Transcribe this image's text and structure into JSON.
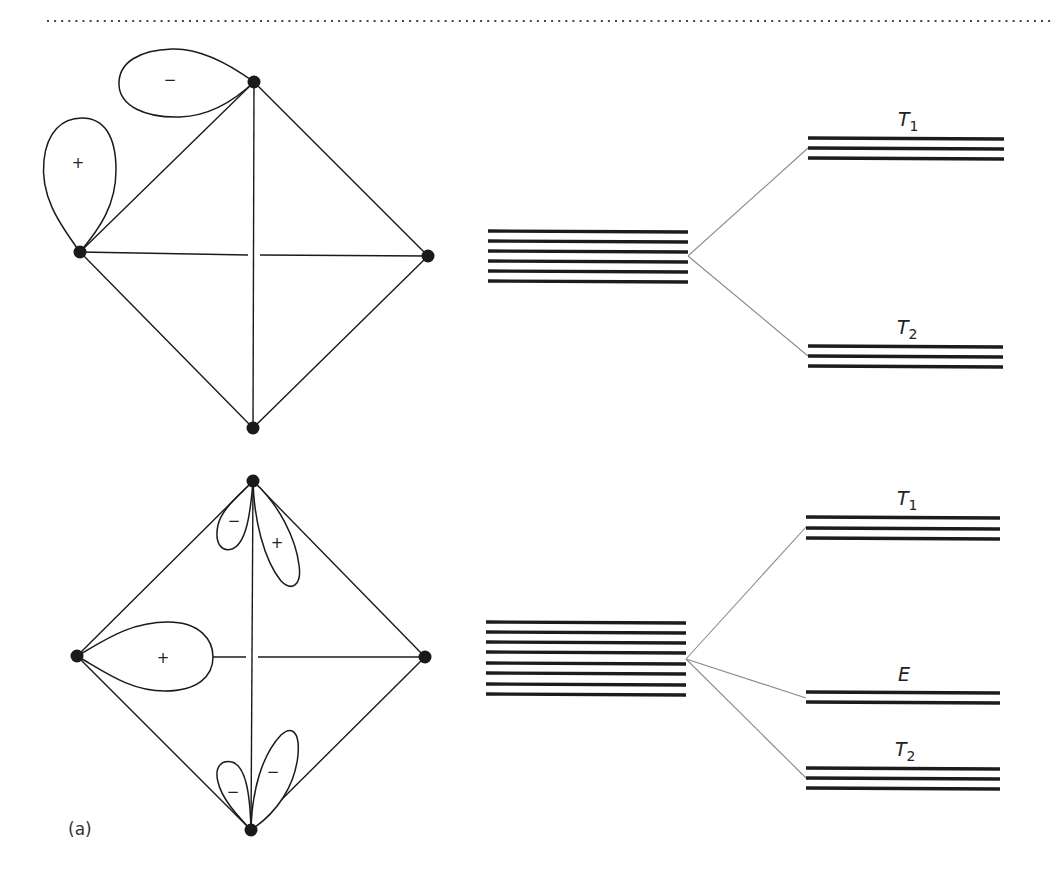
{
  "figure": {
    "panel_label": "(a)",
    "top_separator": "dotted-rule"
  },
  "diagrams": [
    {
      "id": "upper",
      "tetrahedron": {
        "vertices": [
          "top",
          "left",
          "right",
          "bottom"
        ],
        "lobes": [
          {
            "position": "near left vertex, pointing up",
            "sign": "+"
          },
          {
            "position": "near top vertex, pointing left",
            "sign": "−"
          }
        ]
      },
      "splitting": {
        "unsplit_levels": 6,
        "split": [
          {
            "label": "T",
            "subscript": "1",
            "levels": 3,
            "position": "upper"
          },
          {
            "label": "T",
            "subscript": "2",
            "levels": 3,
            "position": "lower"
          }
        ]
      }
    },
    {
      "id": "lower",
      "tetrahedron": {
        "vertices": [
          "top",
          "left",
          "right",
          "bottom"
        ],
        "lobes": [
          {
            "position": "top vertex, left small lobe",
            "sign": "−"
          },
          {
            "position": "top vertex, right long lobe",
            "sign": "+"
          },
          {
            "position": "left vertex, pointing right",
            "sign": "+"
          },
          {
            "position": "bottom vertex, left small lobe",
            "sign": "−"
          },
          {
            "position": "bottom vertex, right long lobe",
            "sign": "−"
          }
        ]
      },
      "splitting": {
        "unsplit_levels": 8,
        "split": [
          {
            "label": "T",
            "subscript": "1",
            "levels": 3,
            "position": "upper"
          },
          {
            "label": "E",
            "subscript": "",
            "levels": 2,
            "position": "middle"
          },
          {
            "label": "T",
            "subscript": "2",
            "levels": 3,
            "position": "lower"
          }
        ]
      }
    }
  ],
  "labels": {
    "upper_t1": "T",
    "upper_t1_sub": "1",
    "upper_t2": "T",
    "upper_t2_sub": "2",
    "lower_t1": "T",
    "lower_t1_sub": "1",
    "lower_e": "E",
    "lower_t2": "T",
    "lower_t2_sub": "2",
    "signs": {
      "upper_left_lobe": "+",
      "upper_top_lobe": "−",
      "lower_top_left_lobe": "−",
      "lower_top_right_lobe": "+",
      "lower_left_lobe": "+",
      "lower_bottom_left_lobe": "−",
      "lower_bottom_right_lobe": "−"
    }
  }
}
